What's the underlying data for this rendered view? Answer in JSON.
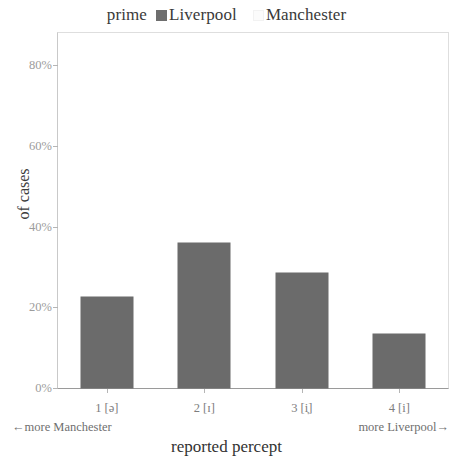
{
  "legend": {
    "prime_label": "prime",
    "entries": [
      {
        "label": "Liverpool",
        "color": "#6b6b6b",
        "swatch": "filled-square-swatch"
      },
      {
        "label": "Manchester",
        "color": "#fbfbfb",
        "swatch": "light-square-swatch"
      }
    ]
  },
  "axis_annotations": {
    "left_anchor": "←more Manchester",
    "right_anchor": "more Liverpool→"
  },
  "chart_data": {
    "type": "bar",
    "title": "",
    "categories": [
      "1 [ə]",
      "2 [ɪ]",
      "3 [i̞]",
      "4 [i]"
    ],
    "series": [
      {
        "name": "Liverpool",
        "values": [
          22.5,
          36,
          28.5,
          13.5
        ],
        "color": "#6b6b6b"
      }
    ],
    "values": [
      22.5,
      36,
      28.5,
      13.5
    ],
    "xlabel": "reported percept",
    "ylabel": "of cases",
    "ylim": [
      0,
      88
    ],
    "ytick_values": [
      0,
      20,
      40,
      60,
      80
    ],
    "ytick_labels": [
      "0%",
      "20%",
      "40%",
      "60%",
      "80%"
    ],
    "grid": false,
    "legend_position": "top-center"
  }
}
